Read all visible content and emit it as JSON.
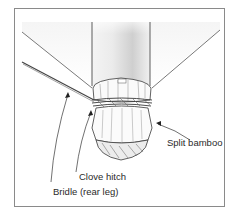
{
  "figure": {
    "labels": {
      "split_bamboo": "Split bamboo",
      "clove_hitch": "Clove hitch",
      "bridle": "Bridle (rear leg)"
    },
    "colors": {
      "line": "#3a3a3a",
      "frame": "#8a8a8a",
      "shade": "#d0d0d0",
      "background": "#ffffff"
    }
  }
}
